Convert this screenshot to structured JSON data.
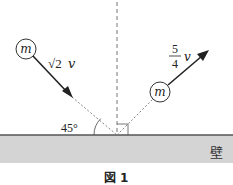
{
  "diagram": {
    "wall_label": "壁",
    "caption": "図 1",
    "angle_label": "45°",
    "ball_incoming": {
      "label": "m",
      "speed_coeff": "√2",
      "speed_var": "v"
    },
    "ball_outgoing": {
      "label": "m",
      "speed_num": "5",
      "speed_den": "4",
      "speed_var": "v"
    },
    "colors": {
      "wall_fill": "#d4d4d4",
      "wall_edge": "#555555",
      "line": "#222222",
      "dashed": "#777777"
    }
  }
}
